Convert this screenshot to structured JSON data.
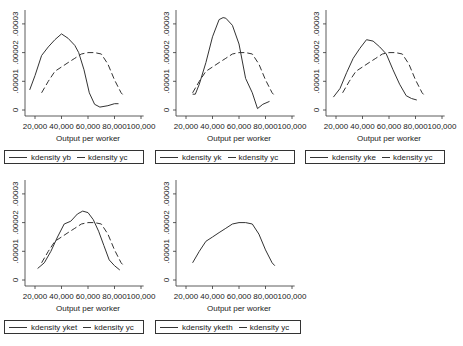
{
  "common": {
    "xlabel": "Output per worker",
    "x_ticks": [
      "20,000",
      "40,000",
      "60,000",
      "80,000",
      "100,000"
    ],
    "x_tick_values": [
      20,
      40,
      60,
      80,
      100
    ],
    "y_ticks": [
      "0",
      ".00001",
      ".00002",
      ".00003"
    ],
    "y_tick_values": [
      0,
      1,
      2,
      3
    ]
  },
  "panels": [
    {
      "legend": {
        "solid": "kdensity yb",
        "dashed": "kdensity yc"
      }
    },
    {
      "legend": {
        "solid": "kdensity yk",
        "dashed": "kdensity yc"
      }
    },
    {
      "legend": {
        "solid": "kdensity yke",
        "dashed": "kdensity yc"
      }
    },
    {
      "legend": {
        "solid": "kdensity yket",
        "dashed": "kdensity yc"
      }
    },
    {
      "legend": {
        "solid": "kdensity yketh",
        "dashed": "kdensity yc"
      }
    }
  ],
  "chart_data": [
    {
      "type": "line",
      "title": "",
      "xlabel": "Output per worker",
      "ylabel": "",
      "xlim": [
        15000,
        100000
      ],
      "ylim": [
        0,
        3e-05
      ],
      "x_tick_labels": [
        "20,000",
        "40,000",
        "60,000",
        "80,000",
        "100,000"
      ],
      "y_tick_labels": [
        "0",
        ".00001",
        ".00002",
        ".00003"
      ],
      "grid": false,
      "legend_position": "bottom",
      "series": [
        {
          "name": "kdensity yb",
          "style": "solid",
          "x": [
            16000,
            20000,
            25000,
            30000,
            35000,
            40000,
            45000,
            50000,
            53000,
            57000,
            61000,
            65000,
            69000,
            75000,
            80000,
            83000
          ],
          "y": [
            7e-06,
            1.2e-05,
            1.9e-05,
            2.2e-05,
            2.45e-05,
            2.65e-05,
            2.5e-05,
            2.25e-05,
            2e-05,
            1.4e-05,
            6e-06,
            2e-06,
            1e-06,
            1.5e-06,
            2.2e-06,
            2.2e-06
          ]
        },
        {
          "name": "kdensity yc",
          "style": "dashed",
          "x": [
            25000,
            30000,
            35000,
            40000,
            45000,
            50000,
            55000,
            60000,
            65000,
            70000,
            75000,
            80000,
            85000,
            87000
          ],
          "y": [
            6e-06,
            1e-05,
            1.35e-05,
            1.5e-05,
            1.65e-05,
            1.8e-05,
            1.95e-05,
            2e-05,
            2e-05,
            1.95e-05,
            1.6e-05,
            1.05e-05,
            6e-06,
            5e-06
          ]
        }
      ]
    },
    {
      "type": "line",
      "title": "",
      "xlabel": "Output per worker",
      "ylabel": "",
      "xlim": [
        15000,
        100000
      ],
      "ylim": [
        0,
        3e-05
      ],
      "x_tick_labels": [
        "20,000",
        "40,000",
        "60,000",
        "80,000",
        "100,000"
      ],
      "y_tick_labels": [
        "0",
        ".00001",
        ".00002",
        ".00003"
      ],
      "grid": false,
      "legend_position": "bottom",
      "series": [
        {
          "name": "kdensity yk",
          "style": "solid",
          "x": [
            25000,
            27000,
            30000,
            35000,
            40000,
            45000,
            48000,
            50000,
            55000,
            60000,
            65000,
            70000,
            74000,
            78000,
            83000
          ],
          "y": [
            5.5e-06,
            5.5e-06,
            9e-06,
            1.65e-05,
            2.55e-05,
            3.15e-05,
            3.22e-05,
            3.2e-05,
            2.95e-05,
            2.3e-05,
            1.1e-05,
            6e-06,
            5e-07,
            2e-06,
            3e-06
          ]
        },
        {
          "name": "kdensity yc",
          "style": "dashed",
          "x": [
            25000,
            30000,
            35000,
            40000,
            45000,
            50000,
            55000,
            60000,
            65000,
            70000,
            75000,
            80000,
            85000,
            87000
          ],
          "y": [
            6e-06,
            1e-05,
            1.35e-05,
            1.5e-05,
            1.65e-05,
            1.8e-05,
            1.95e-05,
            2e-05,
            2e-05,
            1.95e-05,
            1.6e-05,
            1.05e-05,
            6e-06,
            5e-06
          ]
        }
      ]
    },
    {
      "type": "line",
      "title": "",
      "xlabel": "Output per worker",
      "ylabel": "",
      "xlim": [
        15000,
        100000
      ],
      "ylim": [
        0,
        3e-05
      ],
      "x_tick_labels": [
        "20,000",
        "40,000",
        "60,000",
        "80,000",
        "100,000"
      ],
      "y_tick_labels": [
        "0",
        ".00001",
        ".00002",
        ".00003"
      ],
      "grid": false,
      "legend_position": "bottom",
      "series": [
        {
          "name": "kdensity yke",
          "style": "solid",
          "x": [
            18000,
            23000,
            28000,
            33000,
            38000,
            43000,
            48000,
            53000,
            58000,
            63000,
            68000,
            73000,
            77000,
            81000
          ],
          "y": [
            4.5e-06,
            7.5e-06,
            1.3e-05,
            1.8e-05,
            2.15e-05,
            2.45e-05,
            2.4e-05,
            2.2e-05,
            1.95e-05,
            1.4e-05,
            9e-06,
            5e-06,
            4e-06,
            3.5e-06
          ]
        },
        {
          "name": "kdensity yc",
          "style": "dashed",
          "x": [
            25000,
            30000,
            35000,
            40000,
            45000,
            50000,
            55000,
            60000,
            65000,
            70000,
            75000,
            80000,
            85000,
            87000
          ],
          "y": [
            6e-06,
            1e-05,
            1.35e-05,
            1.5e-05,
            1.65e-05,
            1.8e-05,
            1.95e-05,
            2e-05,
            2e-05,
            1.95e-05,
            1.6e-05,
            1.05e-05,
            6e-06,
            5e-06
          ]
        }
      ]
    },
    {
      "type": "line",
      "title": "",
      "xlabel": "Output per worker",
      "ylabel": "",
      "xlim": [
        15000,
        100000
      ],
      "ylim": [
        0,
        3e-05
      ],
      "x_tick_labels": [
        "20,000",
        "40,000",
        "60,000",
        "80,000",
        "100,000"
      ],
      "y_tick_labels": [
        "0",
        ".00001",
        ".00002",
        ".00003"
      ],
      "grid": false,
      "legend_position": "bottom",
      "series": [
        {
          "name": "kdensity yket",
          "style": "solid",
          "x": [
            22000,
            27000,
            32000,
            37000,
            42000,
            47000,
            52000,
            56000,
            60000,
            64000,
            68000,
            72000,
            76000,
            80000,
            84000
          ],
          "y": [
            4e-06,
            6e-06,
            1e-05,
            1.5e-05,
            1.95e-05,
            2.05e-05,
            2.3e-05,
            2.4e-05,
            2.35e-05,
            2.1e-05,
            1.7e-05,
            1.2e-05,
            7e-06,
            5e-06,
            3.5e-06
          ]
        },
        {
          "name": "kdensity yc",
          "style": "dashed",
          "x": [
            25000,
            30000,
            35000,
            40000,
            45000,
            50000,
            55000,
            60000,
            65000,
            70000,
            75000,
            80000,
            85000,
            87000
          ],
          "y": [
            6e-06,
            1e-05,
            1.35e-05,
            1.5e-05,
            1.65e-05,
            1.8e-05,
            1.95e-05,
            2e-05,
            2e-05,
            1.95e-05,
            1.6e-05,
            1.05e-05,
            6e-06,
            5e-06
          ]
        }
      ]
    },
    {
      "type": "line",
      "title": "",
      "xlabel": "Output per worker",
      "ylabel": "",
      "xlim": [
        15000,
        100000
      ],
      "ylim": [
        0,
        3e-05
      ],
      "x_tick_labels": [
        "20,000",
        "40,000",
        "60,000",
        "80,000",
        "100,000"
      ],
      "y_tick_labels": [
        "0",
        ".00001",
        ".00002",
        ".00003"
      ],
      "grid": false,
      "legend_position": "bottom",
      "series": [
        {
          "name": "kdensity yketh",
          "style": "solid",
          "x": [
            25000,
            30000,
            35000,
            40000,
            45000,
            50000,
            55000,
            60000,
            65000,
            70000,
            75000,
            80000,
            85000,
            87000
          ],
          "y": [
            6e-06,
            1e-05,
            1.35e-05,
            1.5e-05,
            1.65e-05,
            1.8e-05,
            1.95e-05,
            2e-05,
            2e-05,
            1.95e-05,
            1.6e-05,
            1.05e-05,
            6e-06,
            5e-06
          ]
        },
        {
          "name": "kdensity yc",
          "style": "dashed",
          "x": [],
          "y": []
        }
      ]
    }
  ]
}
